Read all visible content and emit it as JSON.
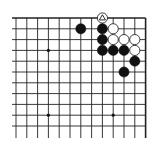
{
  "board": {
    "description": "Go board fragment, top-right corner",
    "visible_cols": 13,
    "visible_rows": 11,
    "origin_x": 16,
    "origin_y": 18,
    "spacing": 10.8,
    "left_clip": 12,
    "bottom_clip": 138,
    "right_edge_col": 12,
    "top_edge_row": 0,
    "line_color": "#222222",
    "background": "#ffffff",
    "star_points": [
      {
        "col": 3,
        "row": 3
      },
      {
        "col": 3,
        "row": 9
      },
      {
        "col": 9,
        "row": 9
      }
    ],
    "stones": [
      {
        "col": 8,
        "row": 0,
        "color": "white",
        "marker": "triangle"
      },
      {
        "col": 6,
        "row": 1,
        "color": "black"
      },
      {
        "col": 8,
        "row": 1,
        "color": "black"
      },
      {
        "col": 9,
        "row": 1,
        "color": "white"
      },
      {
        "col": 8,
        "row": 2,
        "color": "black"
      },
      {
        "col": 9,
        "row": 2,
        "color": "white"
      },
      {
        "col": 10,
        "row": 2,
        "color": "white"
      },
      {
        "col": 11,
        "row": 2,
        "color": "white"
      },
      {
        "col": 8,
        "row": 3,
        "color": "black"
      },
      {
        "col": 9,
        "row": 3,
        "color": "black"
      },
      {
        "col": 10,
        "row": 3,
        "color": "black"
      },
      {
        "col": 11,
        "row": 3,
        "color": "white"
      },
      {
        "col": 11,
        "row": 4,
        "color": "black"
      },
      {
        "col": 10,
        "row": 5,
        "color": "black"
      }
    ]
  }
}
